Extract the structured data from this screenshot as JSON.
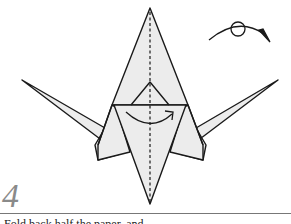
{
  "diagram": {
    "step_number": "4",
    "caption": "Fold back half the paper, and...",
    "colors": {
      "paper_fill": "#ececec",
      "stroke": "#1a1a1a",
      "step_number": "#8a8a8a",
      "rule": "#777777"
    },
    "symbols": [
      "turn-over-arrow-icon",
      "valley-fold-dashed-line",
      "fold-over-arrow-icon"
    ]
  }
}
